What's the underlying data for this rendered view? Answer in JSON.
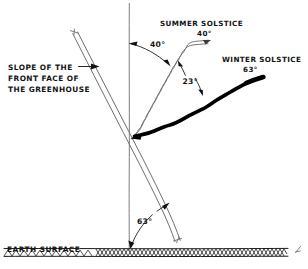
{
  "diagram": {
    "title_type": "hand-drawn solar geometry sketch",
    "labels": {
      "slope_line1": "SLOPE OF THE",
      "slope_line2": "FRONT FACE OF",
      "slope_line3": "THE GREENHOUSE",
      "summer_line1": "SUMMER SOLSTICE",
      "summer_line2": "40°",
      "winter_line1": "WINTER SOLSTICE",
      "winter_line2": "63°",
      "angle_vertical_to_summer": "40°",
      "angle_summer_to_winter": "23°",
      "angle_slope_to_ground": "63°",
      "earth_surface": "EARTH SURFACE"
    },
    "colors": {
      "paper": "#ffffff",
      "ink": "#111111",
      "pencil": "#6e6e6e",
      "winter_ray": "#000000",
      "ground_hatch": "#2b2b2b"
    },
    "values": {
      "summer_altitude_deg": 40,
      "winter_altitude_deg": 63,
      "ray_separation_deg": 23,
      "slope_from_ground_deg": 63
    }
  }
}
